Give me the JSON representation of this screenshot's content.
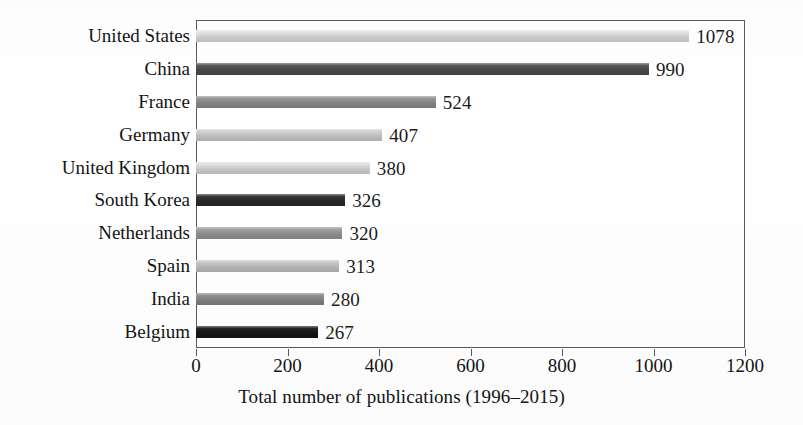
{
  "chart_data": {
    "type": "bar",
    "orientation": "horizontal",
    "title": "",
    "xlabel": "Total number of publications (1996–2015)",
    "ylabel": "",
    "xlim": [
      0,
      1200
    ],
    "xticks": [
      0,
      200,
      400,
      600,
      800,
      1000,
      1200
    ],
    "xtick_labels": [
      "0",
      "200",
      "400",
      "600",
      "800",
      "1000",
      "1200"
    ],
    "grid": false,
    "legend": false,
    "categories": [
      "United States",
      "China",
      "France",
      "Germany",
      "United Kingdom",
      "South Korea",
      "Netherlands",
      "Spain",
      "India",
      "Belgium"
    ],
    "values": [
      1078,
      990,
      524,
      407,
      380,
      326,
      320,
      313,
      280,
      267
    ],
    "value_labels": [
      "1078",
      "990",
      "524",
      "407",
      "380",
      "326",
      "320",
      "313",
      "280",
      "267"
    ],
    "bar_colors": [
      "#e2e2e0",
      "#4e4e4e",
      "#8f8f8f",
      "#cfcfcd",
      "#dcdcda",
      "#2b2b2b",
      "#9a9a98",
      "#c6c6c4",
      "#8a8a88",
      "#161616"
    ]
  },
  "axis": {
    "frame_color": "#555b5e",
    "text_color": "#141414"
  }
}
